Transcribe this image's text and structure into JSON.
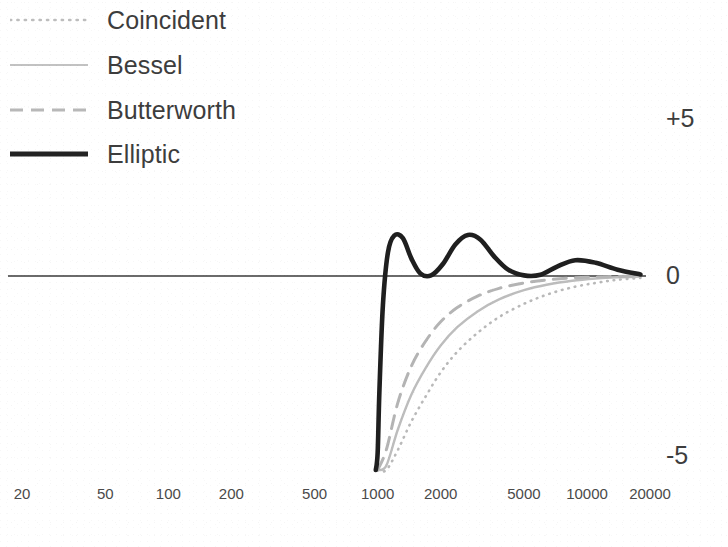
{
  "chart_data": {
    "type": "line",
    "title": "",
    "subtitle": "",
    "xlabel": "",
    "ylabel": "",
    "xscale": "log",
    "xlim": [
      20,
      30000
    ],
    "ylim": [
      -7.2,
      5.8
    ],
    "grid": false,
    "legend_position": "top-left",
    "axis_zero_line": 0,
    "xticks": [
      20,
      50,
      100,
      200,
      500,
      1000,
      2000,
      5000,
      10000,
      20000
    ],
    "xtick_labels": [
      "20",
      "50",
      "100",
      "200",
      "500",
      "1000",
      "2000",
      "5000",
      "10000",
      "20000"
    ],
    "yticks": [
      5,
      0,
      -5
    ],
    "ytick_labels": [
      "+5",
      "0",
      "-5"
    ],
    "series": [
      {
        "name": "Coincident",
        "style": "dotted",
        "color": "#b9b9b9",
        "width": 2.6,
        "x": [
          1000,
          1100,
          1250,
          1450,
          1700,
          2000,
          2400,
          3000,
          3800,
          5000,
          6500,
          8500,
          11000,
          14000,
          18000,
          22000,
          30000
        ],
        "y": [
          -7.2,
          -6.4,
          -5.5,
          -4.6,
          -3.8,
          -3.05,
          -2.4,
          -1.8,
          -1.3,
          -0.88,
          -0.58,
          -0.36,
          -0.22,
          -0.12,
          -0.06,
          -0.03,
          0.0
        ]
      },
      {
        "name": "Bessel",
        "style": "solid",
        "color": "#bdbdbd",
        "width": 2.4,
        "x": [
          1000,
          1100,
          1250,
          1450,
          1700,
          2000,
          2400,
          3000,
          3800,
          5000,
          6500,
          8500,
          11000,
          14000,
          18000,
          22000,
          30000
        ],
        "y": [
          -7.2,
          -6.0,
          -4.85,
          -3.75,
          -2.9,
          -2.2,
          -1.62,
          -1.12,
          -0.74,
          -0.45,
          -0.27,
          -0.15,
          -0.08,
          -0.04,
          -0.02,
          -0.01,
          0.0
        ]
      },
      {
        "name": "Butterworth",
        "style": "dashed",
        "color": "#b4b4b4",
        "width": 3.0,
        "x": [
          1000,
          1100,
          1250,
          1450,
          1700,
          2000,
          2400,
          3000,
          3800,
          5000,
          6500,
          8500,
          11000,
          14000,
          18000,
          22000,
          30000
        ],
        "y": [
          -7.2,
          -5.5,
          -4.0,
          -2.85,
          -2.05,
          -1.45,
          -1.0,
          -0.64,
          -0.39,
          -0.22,
          -0.12,
          -0.06,
          -0.03,
          -0.015,
          -0.007,
          -0.003,
          0.0
        ]
      },
      {
        "name": "Elliptic",
        "style": "solid",
        "color": "#1f1f1f",
        "width": 4.6,
        "x": [
          980,
          1000,
          1020,
          1060,
          1120,
          1200,
          1320,
          1450,
          1600,
          1800,
          2050,
          2350,
          2700,
          3100,
          3600,
          4200,
          5000,
          6000,
          7200,
          8800,
          11000,
          14000,
          18000,
          23000,
          30000
        ],
        "y": [
          -7.2,
          -5.6,
          -3.6,
          -0.9,
          0.75,
          1.28,
          1.2,
          0.55,
          0.08,
          0.02,
          0.38,
          1.0,
          1.3,
          1.15,
          0.62,
          0.2,
          0.02,
          0.04,
          0.3,
          0.5,
          0.42,
          0.2,
          0.05,
          0.0,
          0.0
        ]
      }
    ]
  },
  "legend": {
    "items": [
      {
        "label": "Coincident",
        "style": "dotted",
        "color": "#b9b9b9"
      },
      {
        "label": "Bessel",
        "style": "solid",
        "color": "#bdbdbd"
      },
      {
        "label": "Butterworth",
        "style": "dashed",
        "color": "#b4b4b4"
      },
      {
        "label": "Elliptic",
        "style": "solid",
        "color": "#1f1f1f"
      }
    ]
  },
  "axis": {
    "y_top_label": "+5",
    "y_mid_label": "0",
    "y_bottom_label": "-5"
  }
}
